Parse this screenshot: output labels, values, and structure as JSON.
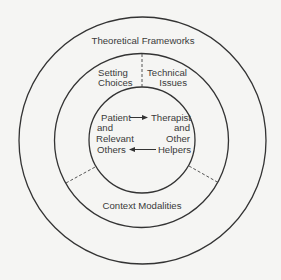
{
  "diagram": {
    "outer_ring": {
      "label": "Theoretical Frameworks"
    },
    "middle_ring": {
      "top_left": {
        "line1": "Setting",
        "line2": "Choices"
      },
      "top_right": {
        "line1": "Technical",
        "line2": "Issues"
      },
      "bottom": {
        "label": "Context Modalities"
      }
    },
    "inner_circle": {
      "left": {
        "line1": "Patient",
        "line2": "and",
        "line3": "Relevant",
        "line4": "Others"
      },
      "right": {
        "line1": "Therapist",
        "line2": "and",
        "line3": "Other",
        "line4": "Helpers"
      },
      "arrows": [
        {
          "from": "Patient and Relevant Others",
          "to": "Therapist and Other Helpers",
          "direction": "right"
        },
        {
          "from": "Therapist and Other Helpers",
          "to": "Patient and Relevant Others",
          "direction": "left"
        }
      ]
    },
    "colors": {
      "background": "#f5f5f3",
      "line": "#333333",
      "text": "#3a3a3a"
    }
  }
}
